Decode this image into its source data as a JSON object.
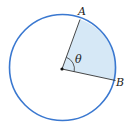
{
  "diagram": {
    "type": "circle-sector",
    "labels": {
      "point_a": "A",
      "point_b": "B",
      "angle": "θ"
    },
    "colors": {
      "circle_stroke": "#3a78d0",
      "sector_fill": "#d6e8f6",
      "radius_stroke": "#333333",
      "center_dot": "#111111"
    }
  }
}
